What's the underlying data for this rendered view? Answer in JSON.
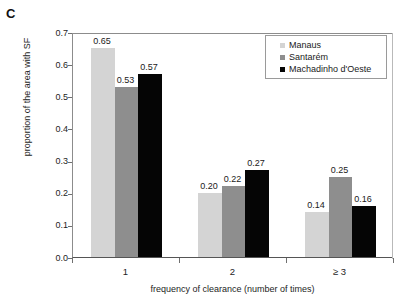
{
  "panel": {
    "label": "C"
  },
  "chart_data": {
    "type": "bar",
    "title": "",
    "xlabel": "frequency of clearance (number of times)",
    "ylabel": "proportion of the area  with SF",
    "categories": [
      "1",
      "2",
      "≥ 3"
    ],
    "ylim": [
      0.0,
      0.7
    ],
    "yticks": [
      "0.0",
      "0.1",
      "0.2",
      "0.3",
      "0.4",
      "0.5",
      "0.6",
      "0.7"
    ],
    "ytick_values": [
      0.0,
      0.1,
      0.2,
      0.3,
      0.4,
      0.5,
      0.6,
      0.7
    ],
    "grid": false,
    "legend_position": "top-right",
    "series": [
      {
        "name": "Manaus",
        "color": "#d4d4d4",
        "values": [
          0.65,
          0.2,
          0.14
        ],
        "labels": [
          "0.65",
          "0.20",
          "0.14"
        ]
      },
      {
        "name": "Santarém",
        "color": "#8e8e8e",
        "values": [
          0.53,
          0.22,
          0.25
        ],
        "labels": [
          "0.53",
          "0.22",
          "0.25"
        ]
      },
      {
        "name": "Machadinho d'Oeste",
        "color": "#050505",
        "values": [
          0.57,
          0.27,
          0.16
        ],
        "labels": [
          "0.57",
          "0.27",
          "0.16"
        ]
      }
    ]
  },
  "legend": {
    "entries": [
      {
        "label": "Manaus"
      },
      {
        "label": "Santarém"
      },
      {
        "label": "Machadinho d'Oeste"
      }
    ]
  }
}
